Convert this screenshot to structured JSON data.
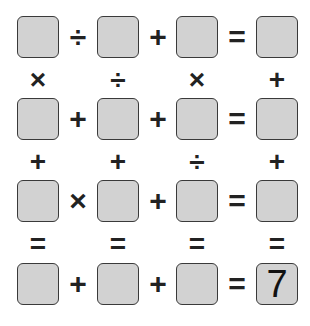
{
  "puzzle": {
    "rows": [
      {
        "cells": [
          "",
          "",
          "",
          ""
        ],
        "ops": [
          "÷",
          "+",
          "="
        ]
      },
      {
        "cells": [
          "",
          "",
          "",
          ""
        ],
        "ops": [
          "+",
          "+",
          "="
        ]
      },
      {
        "cells": [
          "",
          "",
          "",
          ""
        ],
        "ops": [
          "×",
          "+",
          "="
        ]
      },
      {
        "cells": [
          "",
          "",
          "",
          "7"
        ],
        "ops": [
          "+",
          "+",
          "="
        ]
      }
    ],
    "vertical_ops": [
      [
        "×",
        "÷",
        "×",
        "+"
      ],
      [
        "+",
        "+",
        "÷",
        "+"
      ],
      [
        "=",
        "=",
        "=",
        "="
      ]
    ]
  }
}
